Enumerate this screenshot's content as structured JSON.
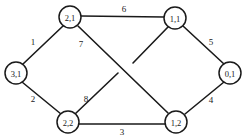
{
  "figure": {
    "type": "undirected-graph",
    "width": 246,
    "height": 137,
    "background_color": "#ffffff",
    "stroke_color": "#1a1a1a",
    "text_color": "#1a1a1a"
  },
  "chart_data": {
    "type": "diagram",
    "title": "",
    "xlabel": "",
    "ylabel": "",
    "nodes": [
      {
        "id": "n21",
        "label": "2,1",
        "x": 70,
        "y": 17,
        "r": 11
      },
      {
        "id": "n11",
        "label": "1,1",
        "x": 175,
        "y": 18,
        "r": 11
      },
      {
        "id": "n31",
        "label": "3,1",
        "x": 16,
        "y": 73,
        "r": 11
      },
      {
        "id": "n01",
        "label": "0,1",
        "x": 230,
        "y": 73,
        "r": 11
      },
      {
        "id": "n22",
        "label": "2,2",
        "x": 68,
        "y": 122,
        "r": 11
      },
      {
        "id": "n12",
        "label": "1,2",
        "x": 176,
        "y": 122,
        "r": 11
      }
    ],
    "edges": [
      {
        "id": "e6",
        "label": "6",
        "from": "n21",
        "to": "n11",
        "x1": 81,
        "y1": 16,
        "x2": 164,
        "y2": 17,
        "label_x": 124,
        "label_y": 9
      },
      {
        "id": "e1",
        "label": "1",
        "from": "n31",
        "to": "n21",
        "x1": 23,
        "y1": 64,
        "x2": 63,
        "y2": 26,
        "label_x": 33,
        "label_y": 42
      },
      {
        "id": "e5",
        "label": "5",
        "from": "n11",
        "to": "n01",
        "x1": 183,
        "y1": 26,
        "x2": 224,
        "y2": 64,
        "label_x": 211,
        "label_y": 42
      },
      {
        "id": "e7",
        "label": "7",
        "from": "n21",
        "to": "n12",
        "x1": 78,
        "y1": 26,
        "x2": 168,
        "y2": 113,
        "label_x": 81,
        "label_y": 44
      },
      {
        "id": "e2",
        "label": "2",
        "from": "n31",
        "to": "n22",
        "x1": 22,
        "y1": 82,
        "x2": 61,
        "y2": 114,
        "label_x": 33,
        "label_y": 99
      },
      {
        "id": "e8",
        "label": "8",
        "from": "n22",
        "to": "n11",
        "x1": 75,
        "y1": 114,
        "x2": 118,
        "y2": 73,
        "label_x": 86,
        "label_y": 99
      },
      {
        "id": "e8b",
        "label": "",
        "from": "n11",
        "to": "n22",
        "x1": 168,
        "y1": 27,
        "x2": 133,
        "y2": 63,
        "label_x": 0,
        "label_y": 0
      },
      {
        "id": "e3",
        "label": "3",
        "from": "n22",
        "to": "n12",
        "x1": 79,
        "y1": 124,
        "x2": 165,
        "y2": 124,
        "label_x": 122,
        "label_y": 132
      },
      {
        "id": "e4",
        "label": "4",
        "from": "n12",
        "to": "n01",
        "x1": 185,
        "y1": 114,
        "x2": 224,
        "y2": 82,
        "label_x": 211,
        "label_y": 100
      }
    ]
  }
}
